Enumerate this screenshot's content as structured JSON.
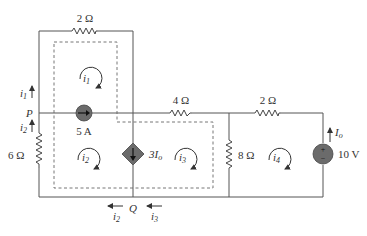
{
  "figure": {
    "type": "circuit-schematic",
    "resistors": [
      {
        "id": "r-top",
        "label": "2 Ω"
      },
      {
        "id": "r-mid",
        "label": "4 Ω"
      },
      {
        "id": "r-right-top",
        "label": "2 Ω"
      },
      {
        "id": "r-left",
        "label": "6 Ω"
      },
      {
        "id": "r-8",
        "label": "8 Ω"
      }
    ],
    "sources": {
      "current_source": {
        "label": "5 A"
      },
      "dependent_source": {
        "label": "3I",
        "subscript": "o"
      },
      "voltage_source": {
        "label": "10 V",
        "plus": "+",
        "minus": "−"
      }
    },
    "currents": {
      "i1": {
        "base": "i",
        "sub": "1"
      },
      "i2": {
        "base": "i",
        "sub": "2"
      },
      "i3": {
        "base": "i",
        "sub": "3"
      },
      "i4": {
        "base": "i",
        "sub": "4"
      },
      "Io": {
        "base": "I",
        "sub": "o"
      }
    },
    "nodes": {
      "P": "P",
      "Q": "Q"
    },
    "colors": {
      "wire": "#555555",
      "source_fill": "#6b6b6b",
      "text": "#333333"
    }
  }
}
